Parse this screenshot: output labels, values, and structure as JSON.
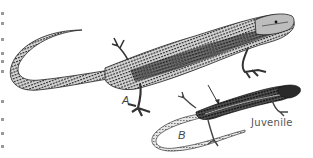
{
  "figure": {
    "subjects": [
      {
        "id": "A",
        "label": "A",
        "description": "adult lizard, large, striped dorsal pattern"
      },
      {
        "id": "B",
        "label": "B",
        "description": "juvenile lizard, smaller, dark dorsum with pale stripes, long tail"
      }
    ],
    "juvenile_caption": "Juvenile",
    "arrow": {
      "from": "adult",
      "to": "juvenile"
    },
    "colors": {
      "ink": "#1a1a1a",
      "mid": "#6b6b6b",
      "light": "#bdbdbd",
      "paper": "#ffffff"
    }
  }
}
